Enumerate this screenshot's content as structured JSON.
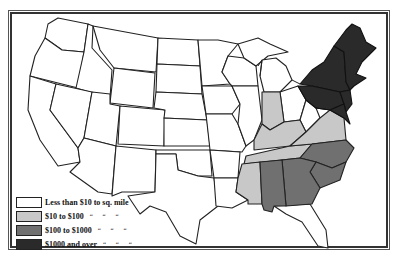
{
  "map": {
    "subject": "United States land value per square mile",
    "legend": {
      "items": [
        {
          "label": "Less than $10 to sq. mile",
          "ditto": "",
          "color": "#ffffff"
        },
        {
          "label": "$10 to $100",
          "ditto": "“ “ “",
          "color": "#c8c8c8"
        },
        {
          "label": "$100 to $1000",
          "ditto": "“ “ “",
          "color": "#707070"
        },
        {
          "label": "$1000 and over",
          "ditto": "“ “ “",
          "color": "#2a2a2a"
        }
      ]
    },
    "colors": {
      "border": "#222222",
      "land": "#ffffff",
      "tier1": "#c8c8c8",
      "tier2": "#707070",
      "tier3": "#2a2a2a"
    },
    "shaded_regions": {
      "over_1000": [
        "Maine",
        "New Hampshire",
        "Vermont",
        "Massachusetts",
        "Connecticut",
        "Rhode Island",
        "New York",
        "New Jersey",
        "Pennsylvania",
        "Delaware",
        "Maryland"
      ],
      "100_to_1000": [
        "North Carolina",
        "South Carolina",
        "Georgia",
        "Alabama"
      ],
      "10_to_100": [
        "Indiana",
        "Kentucky",
        "Tennessee",
        "Virginia",
        "Mississippi"
      ]
    }
  }
}
